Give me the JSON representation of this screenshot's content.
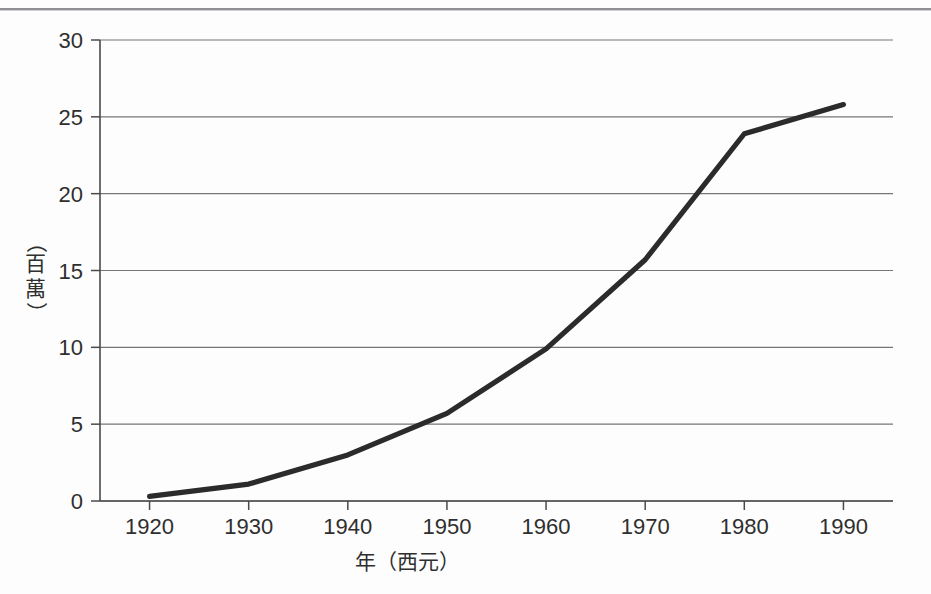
{
  "chart_data": {
    "type": "line",
    "title": "",
    "xlabel": "年（西元）",
    "ylabel": "（百萬）",
    "ylabel_chars": [
      "（",
      "百",
      "萬",
      "）"
    ],
    "x": [
      1920,
      1930,
      1940,
      1950,
      1960,
      1970,
      1980,
      1990
    ],
    "values": [
      0.3,
      1.1,
      3.0,
      5.7,
      9.9,
      15.7,
      23.9,
      25.8
    ],
    "series": [
      {
        "name": "人口",
        "values": [
          0.3,
          1.1,
          3.0,
          5.7,
          9.9,
          15.7,
          23.9,
          25.8
        ]
      }
    ],
    "xlim": [
      1915,
      1995
    ],
    "ylim": [
      0,
      30
    ],
    "xticks": [
      1920,
      1930,
      1940,
      1950,
      1960,
      1970,
      1980,
      1990
    ],
    "xtick_labels": [
      "1920",
      "1930",
      "1940",
      "1950",
      "1960",
      "1970",
      "1980",
      "1990"
    ],
    "yticks": [
      0,
      5,
      10,
      15,
      20,
      25,
      30
    ],
    "ytick_labels": [
      "0",
      "5",
      "10",
      "15",
      "20",
      "25",
      "30"
    ],
    "grid": true,
    "grid_axis": "y",
    "legend": false,
    "legend_position": "none",
    "line_color": "#2b2b2b",
    "grid_color": "#767676",
    "axis_color": "#4a4a4a",
    "background_color": "#fdfdfd"
  },
  "page": {
    "background_color": "#fdfdfd",
    "rule_color": "#8e9095"
  }
}
